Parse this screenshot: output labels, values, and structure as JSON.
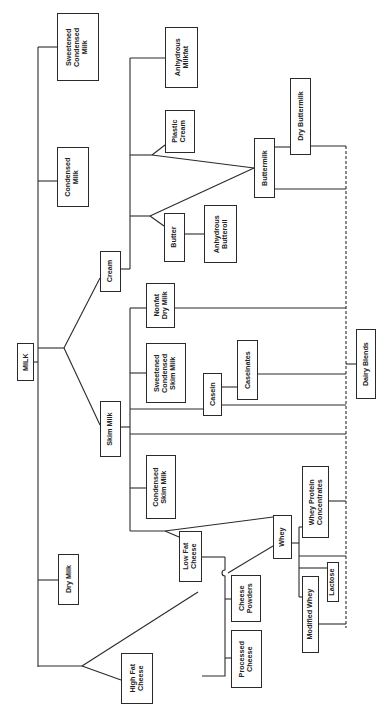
{
  "diagram": {
    "orientation": "rotated-90-ccw",
    "colors": {
      "line": "#2a2a2a",
      "box_border": "#2a2a2a",
      "text": "#222222",
      "background": "#ffffff"
    },
    "nodes": {
      "milk": {
        "label": "MILK",
        "box": [
          17,
          343,
          17,
          38
        ]
      },
      "sweetened_condensed_milk": {
        "label": "Sweetened\nCondensed\nMilk",
        "box": [
          57,
          13,
          42,
          68
        ]
      },
      "condensed_milk": {
        "label": "Condensed\nMilk",
        "box": [
          57,
          147,
          32,
          60
        ]
      },
      "dry_milk": {
        "label": "Dry Milk",
        "box": [
          58,
          554,
          21,
          51
        ]
      },
      "cream": {
        "label": "Cream",
        "box": [
          100,
          251,
          21,
          41
        ]
      },
      "skim_milk": {
        "label": "Skim Milk",
        "box": [
          100,
          401,
          21,
          56
        ]
      },
      "high_fat_cheese": {
        "label": "High Fat\nCheese",
        "box": [
          121,
          653,
          32,
          51
        ]
      },
      "anhydrous_milkfat": {
        "label": "Anhydrous\nMilkfat",
        "box": [
          165,
          27,
          33,
          61
        ]
      },
      "plastic_cream": {
        "label": "Plastic\nCream",
        "box": [
          165,
          110,
          30,
          43
        ]
      },
      "butter": {
        "label": "Butter",
        "box": [
          164,
          213,
          21,
          49
        ]
      },
      "anhydrous_butteroil": {
        "label": "Anhydrous\nButteroil",
        "box": [
          204,
          205,
          33,
          58
        ]
      },
      "buttermilk": {
        "label": "Buttermilk",
        "box": [
          254,
          138,
          21,
          60
        ]
      },
      "dry_buttermilk": {
        "label": "Dry Buttermilk",
        "box": [
          290,
          78,
          21,
          77
        ]
      },
      "nonfat_dry_milk": {
        "label": "Nonfat\nDry Milk",
        "box": [
          146,
          283,
          29,
          45
        ]
      },
      "sweetened_condensed_skim_milk": {
        "label": "Sweetened\nCondensed\nSkim Milk",
        "box": [
          146,
          343,
          40,
          60
        ]
      },
      "casein": {
        "label": "Casein",
        "box": [
          203,
          373,
          19,
          43
        ]
      },
      "caseinates": {
        "label": "Caseinates",
        "box": [
          237,
          340,
          21,
          60
        ]
      },
      "condensed_skim_milk": {
        "label": "Condensed\nSkim Milk",
        "box": [
          146,
          455,
          30,
          64
        ]
      },
      "low_fat_cheese": {
        "label": "Low Fat\nCheese",
        "box": [
          179,
          531,
          23,
          51
        ]
      },
      "whey": {
        "label": "Whey",
        "box": [
          273,
          515,
          19,
          44
        ]
      },
      "whey_protein_concentrates": {
        "label": "Whey Protein\nConcentrates",
        "box": [
          302,
          466,
          27,
          72
        ]
      },
      "dairy_blends": {
        "label": "Dairy Blends",
        "box": [
          356,
          329,
          20,
          70
        ]
      },
      "cheese_powders": {
        "label": "Cheese\nPowders",
        "box": [
          231,
          575,
          30,
          47
        ]
      },
      "processed_cheese": {
        "label": "Processed\nCheese",
        "box": [
          231,
          630,
          31,
          58
        ]
      },
      "lactose": {
        "label": "Lactose",
        "box": [
          327,
          562,
          12,
          40
        ]
      },
      "modified_whey": {
        "label": "Modified Whey",
        "box": [
          302,
          576,
          17,
          77
        ]
      }
    },
    "edges": [
      [
        "MILK",
        "Sweetened Condensed Milk"
      ],
      [
        "MILK",
        "Condensed Milk"
      ],
      [
        "MILK",
        "Dry Milk"
      ],
      [
        "MILK",
        "High Fat Cheese"
      ],
      [
        "MILK",
        "Cream"
      ],
      [
        "MILK",
        "Skim Milk"
      ],
      [
        "Cream",
        "Anhydrous Milkfat"
      ],
      [
        "Cream",
        "Plastic Cream"
      ],
      [
        "Cream",
        "Butter"
      ],
      [
        "Cream",
        "Buttermilk"
      ],
      [
        "Butter",
        "Anhydrous Butteroil"
      ],
      [
        "Buttermilk",
        "Dry Buttermilk"
      ],
      [
        "Skim Milk",
        "Nonfat Dry Milk"
      ],
      [
        "Skim Milk",
        "Sweetened Condensed Skim Milk"
      ],
      [
        "Skim Milk",
        "Casein"
      ],
      [
        "Skim Milk",
        "Condensed Skim Milk"
      ],
      [
        "Skim Milk",
        "Low Fat Cheese"
      ],
      [
        "Skim Milk",
        "Whey"
      ],
      [
        "Casein",
        "Caseinates"
      ],
      [
        "High Fat Cheese",
        "Whey"
      ],
      [
        "High Fat Cheese",
        "Low Fat Cheese"
      ],
      [
        "Low Fat Cheese",
        "Cheese Powders"
      ],
      [
        "Low Fat Cheese",
        "Processed Cheese"
      ],
      [
        "Whey",
        "Whey Protein Concentrates"
      ],
      [
        "Whey",
        "Lactose"
      ],
      [
        "Whey",
        "Modified Whey"
      ],
      [
        "Dry Buttermilk",
        "Dairy Blends"
      ],
      [
        "Buttermilk",
        "Dairy Blends"
      ],
      [
        "Nonfat Dry Milk",
        "Dairy Blends"
      ],
      [
        "Caseinates",
        "Dairy Blends"
      ],
      [
        "Casein",
        "Dairy Blends"
      ],
      [
        "Skim Milk",
        "Dairy Blends"
      ],
      [
        "Whey Protein Concentrates",
        "Dairy Blends"
      ],
      [
        "Lactose",
        "Dairy Blends"
      ],
      [
        "Modified Whey",
        "Dairy Blends"
      ]
    ]
  }
}
